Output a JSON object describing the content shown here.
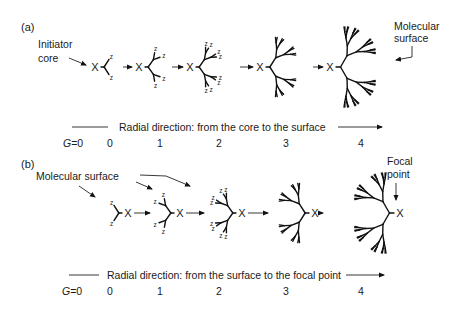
{
  "figure": {
    "panels": [
      {
        "id": "a",
        "label": "(a)",
        "annotations": {
          "left": [
            "Initiator",
            "core"
          ],
          "right": [
            "Molecular",
            "surface"
          ]
        },
        "direction_text": "Radial direction: from the core to the surface",
        "generation_prefix": "G",
        "generation_labels": [
          "G=0",
          "0",
          "1",
          "2",
          "3",
          "4"
        ],
        "core_symbol": "X",
        "end_group_symbol": "z",
        "orientation": "divergent"
      },
      {
        "id": "b",
        "label": "(b)",
        "annotations": {
          "left": [
            "Molecular surface"
          ],
          "right": [
            "Focal",
            "point"
          ]
        },
        "direction_text": "Radial direction: from the surface to the focal point",
        "generation_prefix": "G",
        "generation_labels": [
          "G=0",
          "0",
          "1",
          "2",
          "3",
          "4"
        ],
        "core_symbol": "X",
        "end_group_symbol": "z",
        "orientation": "convergent"
      }
    ],
    "colors": {
      "ink": "#111111",
      "background": "#ffffff"
    }
  }
}
